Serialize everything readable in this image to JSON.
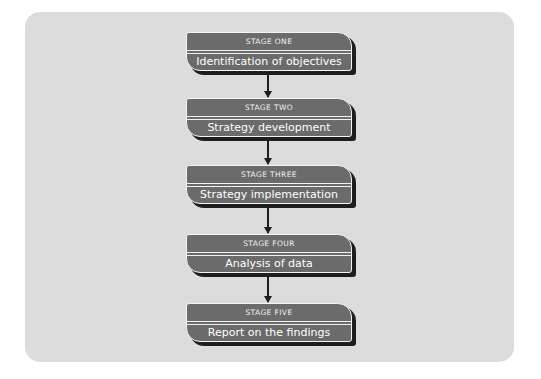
{
  "diagram": {
    "type": "flowchart",
    "direction": "top-to-bottom",
    "colors": {
      "page_background": "#ffffff",
      "panel_background": "#dcdcdc",
      "box_fill": "#6b6b6b",
      "box_border": "#f4f4f4",
      "box_shadow": "#1e1e1e",
      "text": "#ffffff",
      "arrow": "#1e1e1e"
    },
    "stages": [
      {
        "label": "STAGE  ONE",
        "title": "Identification of objectives"
      },
      {
        "label": "STAGE  TWO",
        "title": "Strategy development"
      },
      {
        "label": "STAGE  THREE",
        "title": "Strategy implementation"
      },
      {
        "label": "STAGE  FOUR",
        "title": "Analysis of data"
      },
      {
        "label": "STAGE  FIVE",
        "title": "Report on the findings"
      }
    ],
    "connections": [
      {
        "from": 0,
        "to": 1
      },
      {
        "from": 1,
        "to": 2
      },
      {
        "from": 2,
        "to": 3
      },
      {
        "from": 3,
        "to": 4
      }
    ]
  }
}
